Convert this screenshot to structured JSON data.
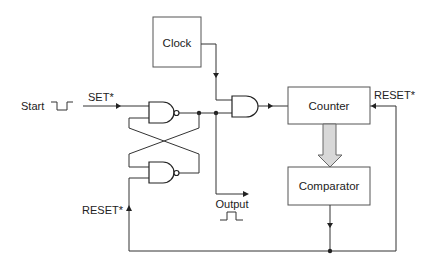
{
  "diagram": {
    "type": "logic-circuit",
    "blocks": {
      "clock": {
        "label": "Clock"
      },
      "counter": {
        "label": "Counter"
      },
      "comparator": {
        "label": "Comparator"
      }
    },
    "signals": {
      "start": {
        "label": "Start"
      },
      "set": {
        "label": "SET*"
      },
      "reset_left": {
        "label": "RESET*"
      },
      "reset_right": {
        "label": "RESET*"
      },
      "output": {
        "label": "Output"
      }
    },
    "gates": [
      {
        "id": "nand-top",
        "type": "NAND"
      },
      {
        "id": "nand-bottom",
        "type": "NAND"
      },
      {
        "id": "and",
        "type": "AND"
      }
    ],
    "colors": {
      "wire": "#333333",
      "thick_arrow_fill": "#d8d8d8"
    }
  }
}
